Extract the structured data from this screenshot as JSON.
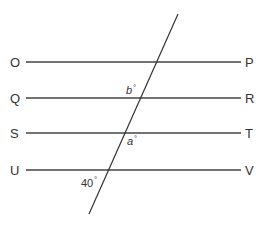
{
  "diagram": {
    "type": "parallel-lines-with-transversal",
    "parallel_lines": [
      {
        "left": "O",
        "right": "P"
      },
      {
        "left": "Q",
        "right": "R"
      },
      {
        "left": "S",
        "right": "T"
      },
      {
        "left": "U",
        "right": "V"
      }
    ],
    "angles": {
      "b": {
        "variable": "b",
        "degree_symbol": "°"
      },
      "a": {
        "variable": "a",
        "degree_symbol": "°"
      },
      "given": {
        "value": "40",
        "degree_symbol": "°"
      }
    },
    "colors": {
      "line": "#444444",
      "text": "#333333",
      "background": "#ffffff"
    }
  }
}
